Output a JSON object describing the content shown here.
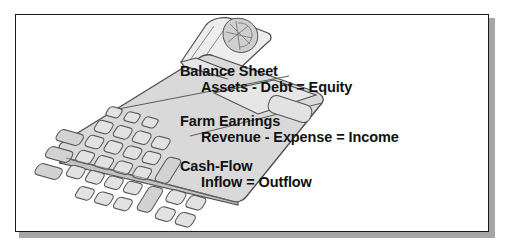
{
  "figure": {
    "background_color": "#ffffff",
    "border_color": "#1a1a1a",
    "shadow_color": "#a6a6a6",
    "illustration": {
      "name": "printing-calculator",
      "description": "Line drawing of a printing desktop calculator tilted in perspective with paper roll",
      "body_color": "#d9d9d9",
      "outline_color": "#4d4d4d",
      "key_color": "#e0e0e0",
      "paper_color": "#ececec"
    }
  },
  "blocks": [
    {
      "id": "balance-sheet",
      "title": "Balance Sheet",
      "formula": "Assets - Debt = Equity"
    },
    {
      "id": "farm-earnings",
      "title": "Farm Earnings",
      "formula": "Revenue - Expense = Income"
    },
    {
      "id": "cash-flow",
      "title": "Cash-Flow",
      "formula": "Inflow = Outflow"
    }
  ]
}
